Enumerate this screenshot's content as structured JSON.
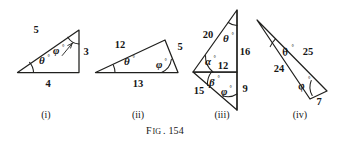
{
  "figure": {
    "caption_prefix": "F",
    "caption_prefix_rest": "IG",
    "caption_number": ". 154",
    "caption_full": "Fig. 154",
    "background_color": "#ffffff",
    "ink_color": "#20201e"
  },
  "panels": [
    {
      "id": "i",
      "roman_label": "(i)",
      "shape": "right-triangle",
      "side_labels": [
        "5",
        "3",
        "4"
      ],
      "angle_labels": [
        "θ",
        "φ"
      ],
      "degree_symbol": "°",
      "sides": [
        {
          "name": "hypotenuse",
          "value": "5"
        },
        {
          "name": "vertical-side",
          "value": "3"
        },
        {
          "name": "base",
          "value": "4"
        }
      ],
      "angles": [
        {
          "name": "theta",
          "symbol": "θ",
          "vertex": "left"
        },
        {
          "name": "phi",
          "symbol": "φ",
          "vertex": "top"
        }
      ]
    },
    {
      "id": "ii",
      "roman_label": "(ii)",
      "shape": "scalene-triangle",
      "side_labels": [
        "12",
        "5",
        "13"
      ],
      "angle_labels": [
        "θ",
        "φ"
      ],
      "degree_symbol": "°",
      "sides": [
        {
          "name": "upper-left-side",
          "value": "12"
        },
        {
          "name": "right-side",
          "value": "5"
        },
        {
          "name": "base",
          "value": "13"
        }
      ],
      "angles": [
        {
          "name": "theta",
          "symbol": "θ",
          "vertex": "left"
        },
        {
          "name": "phi",
          "symbol": "φ",
          "vertex": "bottom-right"
        }
      ]
    },
    {
      "id": "iii",
      "roman_label": "(iii)",
      "shape": "compound-two-triangles",
      "side_labels": [
        "20",
        "16",
        "12",
        "15",
        "9"
      ],
      "angle_labels": [
        "θ",
        "α",
        "β",
        "φ"
      ],
      "degree_symbol": "°",
      "sides": [
        {
          "name": "upper-left-side",
          "value": "20"
        },
        {
          "name": "upper-right-side",
          "value": "16"
        },
        {
          "name": "shared-side",
          "value": "12"
        },
        {
          "name": "lower-left-side",
          "value": "15"
        },
        {
          "name": "lower-right-side",
          "value": "9"
        }
      ],
      "angles": [
        {
          "name": "theta",
          "symbol": "θ",
          "vertex": "top"
        },
        {
          "name": "alpha",
          "symbol": "α",
          "vertex": "left-upper"
        },
        {
          "name": "beta",
          "symbol": "β",
          "vertex": "left-lower"
        },
        {
          "name": "phi",
          "symbol": "φ",
          "vertex": "bottom"
        }
      ]
    },
    {
      "id": "iv",
      "roman_label": "(iv)",
      "shape": "thin-triangle",
      "side_labels": [
        "25",
        "24",
        "7"
      ],
      "angle_labels": [
        "θ",
        "φ"
      ],
      "degree_symbol": "°",
      "sides": [
        {
          "name": "upper-right-side",
          "value": "25"
        },
        {
          "name": "left-side",
          "value": "24"
        },
        {
          "name": "short-side",
          "value": "7"
        }
      ],
      "angles": [
        {
          "name": "theta",
          "symbol": "θ",
          "vertex": "apex"
        },
        {
          "name": "phi",
          "symbol": "φ",
          "vertex": "right"
        }
      ]
    }
  ]
}
